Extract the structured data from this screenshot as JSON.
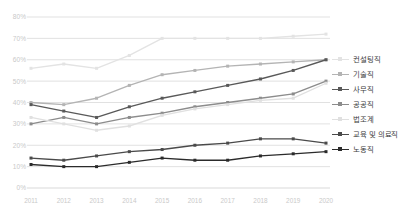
{
  "chart_data": {
    "type": "line",
    "title": "",
    "subtitle": "",
    "xlabel": "",
    "ylabel": "",
    "grid": true,
    "legend_position": "right",
    "ylim": [
      0,
      80
    ],
    "ytick_labels": [
      "80%",
      "70%",
      "60%",
      "50%",
      "40%",
      "30%",
      "20%",
      "10%",
      "0%"
    ],
    "ytick_values": [
      80,
      70,
      60,
      50,
      40,
      30,
      20,
      10,
      0
    ],
    "categories": [
      "2011",
      "2012",
      "2013",
      "2014",
      "2015",
      "2016",
      "2017",
      "2018",
      "2019",
      "2020"
    ],
    "x": [
      2011,
      2012,
      2013,
      2014,
      2015,
      2016,
      2017,
      2018,
      2019,
      2020
    ],
    "series": [
      {
        "name": "컨설팅직",
        "color": "#e3e3e3",
        "values": [
          56,
          58,
          56,
          62,
          70,
          70,
          70,
          70,
          71,
          72
        ]
      },
      {
        "name": "기술직",
        "color": "#b4b4b4",
        "values": [
          40,
          39,
          42,
          48,
          53,
          55,
          57,
          58,
          59,
          60
        ]
      },
      {
        "name": "사무직",
        "color": "#595959",
        "values": [
          39,
          36,
          33,
          38,
          42,
          45,
          48,
          51,
          55,
          60
        ]
      },
      {
        "name": "공공직",
        "color": "#8c8c8c",
        "values": [
          30,
          33,
          30,
          33,
          35,
          38,
          40,
          42,
          44,
          50
        ]
      },
      {
        "name": "법조계",
        "color": "#e0e0e0",
        "values": [
          33,
          30,
          27,
          29,
          34,
          37,
          39,
          41,
          42,
          49
        ]
      },
      {
        "name": "교육 및 의료직",
        "color": "#4a4a4a",
        "values": [
          14,
          13,
          15,
          17,
          18,
          20,
          21,
          23,
          23,
          21
        ]
      },
      {
        "name": "노동직",
        "color": "#2b2b2b",
        "values": [
          11,
          10,
          10,
          12,
          14,
          13,
          13,
          15,
          16,
          17
        ]
      }
    ]
  },
  "legend": {
    "items": [
      {
        "label": "컨설팅직"
      },
      {
        "label": "기술직"
      },
      {
        "label": "사무직"
      },
      {
        "label": "공공직"
      },
      {
        "label": "법조계"
      },
      {
        "label": "교육 및 의료직"
      },
      {
        "label": "노동직"
      }
    ]
  },
  "axes": {
    "y_labels": [
      "80%",
      "70%",
      "60%",
      "50%",
      "40%",
      "30%",
      "20%",
      "10%",
      "0%"
    ],
    "x_labels": [
      "2011",
      "2012",
      "2013",
      "2014",
      "2015",
      "2016",
      "2017",
      "2018",
      "2019",
      "2020"
    ]
  },
  "colors": {
    "grid": "#d9d9d9",
    "axis_text": "#c9c9c9",
    "legend_text": "#3c3c3c",
    "background": "#ffffff"
  }
}
